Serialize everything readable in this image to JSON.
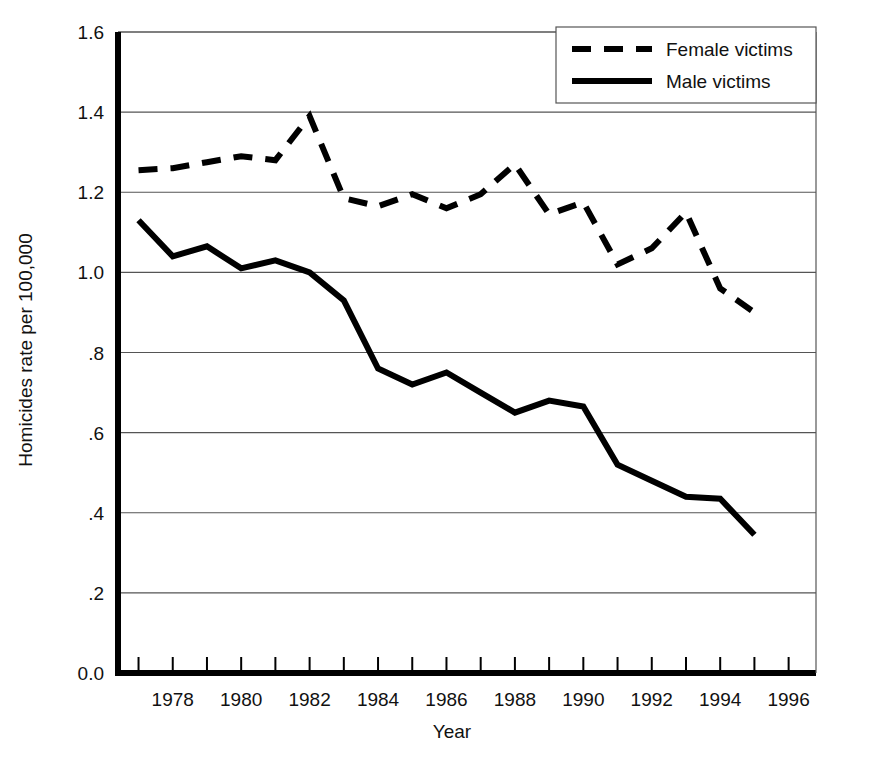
{
  "chart_data": {
    "type": "line",
    "title": "",
    "xlabel": "Year",
    "ylabel": "Homicides rate per 100,000",
    "xlim": [
      1976.4,
      1996.8
    ],
    "ylim": [
      0.0,
      1.6
    ],
    "grid": true,
    "legend_position": "top-right",
    "x_tick_labels": [
      "1978",
      "1980",
      "1982",
      "1984",
      "1986",
      "1988",
      "1990",
      "1992",
      "1994",
      "1996"
    ],
    "x_tick_values": [
      1978,
      1980,
      1982,
      1984,
      1986,
      1988,
      1990,
      1992,
      1994,
      1996
    ],
    "x_minor_tick_values": [
      1977,
      1979,
      1981,
      1983,
      1985,
      1987,
      1989,
      1991,
      1993,
      1995
    ],
    "y_tick_labels": [
      "0.0",
      ".2",
      ".4",
      ".6",
      ".8",
      "1.0",
      "1.2",
      "1.4",
      "1.6"
    ],
    "y_tick_values": [
      0.0,
      0.2,
      0.4,
      0.6,
      0.8,
      1.0,
      1.2,
      1.4,
      1.6
    ],
    "x": [
      1977,
      1978,
      1979,
      1980,
      1981,
      1982,
      1983,
      1984,
      1985,
      1986,
      1987,
      1988,
      1989,
      1990,
      1991,
      1992,
      1993,
      1994,
      1995
    ],
    "series": [
      {
        "name": "Female victims",
        "style": "dashed",
        "color": "#000000",
        "values": [
          1.255,
          1.26,
          1.275,
          1.29,
          1.28,
          1.39,
          1.185,
          1.165,
          1.195,
          1.16,
          1.195,
          1.27,
          1.145,
          1.175,
          1.02,
          1.06,
          1.15,
          0.96,
          0.9
        ]
      },
      {
        "name": "Male victims",
        "style": "solid",
        "color": "#000000",
        "values": [
          1.13,
          1.04,
          1.065,
          1.01,
          1.03,
          1.0,
          0.93,
          0.76,
          0.72,
          0.75,
          0.7,
          0.65,
          0.68,
          0.665,
          0.52,
          0.48,
          0.44,
          0.435,
          0.345
        ]
      }
    ]
  },
  "legend": {
    "items": [
      {
        "label": "Female victims",
        "style": "dashed"
      },
      {
        "label": "Male victims",
        "style": "solid"
      }
    ]
  }
}
